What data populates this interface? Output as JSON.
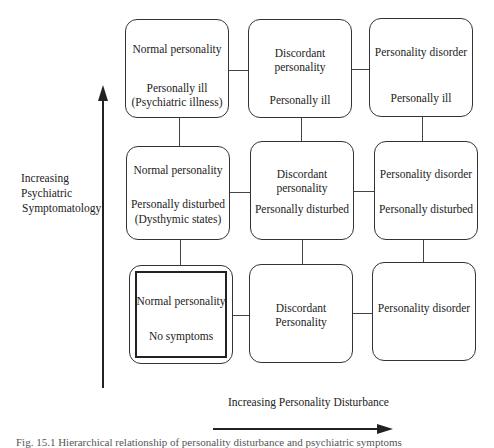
{
  "grid": {
    "row1": [
      {
        "top": "Normal personality",
        "bottom": "Personally ill",
        "bottom2": "(Psychiatric illness)"
      },
      {
        "top": "Discordant",
        "top2": "personality",
        "bottom": "Personally ill"
      },
      {
        "top": "Personality disorder",
        "bottom": "Personally ill"
      }
    ],
    "row2": [
      {
        "top": "Normal personality",
        "bottom": "Personally disturbed",
        "bottom2": "(Dysthymic states)"
      },
      {
        "top": "Discordant",
        "top2": "personality",
        "bottom": "Personally disturbed"
      },
      {
        "top": "Personality disorder",
        "bottom": "Personally disturbed"
      }
    ],
    "row3": [
      {
        "top": "Normal personality",
        "bottom": "No symptoms",
        "highlighted": true
      },
      {
        "top": "Discordant",
        "top2": "Personality"
      },
      {
        "top": "Personality disorder"
      }
    ]
  },
  "axes": {
    "y_label": [
      "Increasing",
      "Psychiatric",
      "Symptomatology"
    ],
    "x_label": "Increasing Personality Disturbance"
  },
  "caption": "Fig. 15.1  Hierarchical relationship of personality disturbance and psychiatric symptoms"
}
